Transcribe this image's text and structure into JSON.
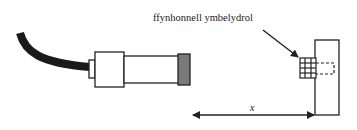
{
  "diagram": {
    "labels": {
      "source": "ffynhonnell ymbelydrol",
      "distance": "x"
    },
    "components": [
      {
        "name": "cable",
        "color": "#1a1a1a"
      },
      {
        "name": "detector-tube",
        "window_color": "#7a7a7a"
      },
      {
        "name": "radioactive-source"
      },
      {
        "name": "source-holder-block"
      },
      {
        "name": "distance-arrow"
      }
    ],
    "colors": {
      "line": "#222222",
      "cable": "#1a1a1a",
      "window": "#7a7a7a",
      "background": "#ffffff"
    }
  }
}
